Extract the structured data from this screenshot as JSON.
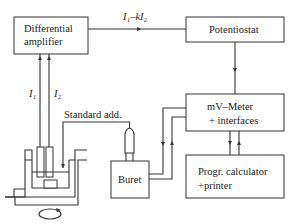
{
  "diagram": {
    "blocks": {
      "differential_amplifier": {
        "line1": "Differential",
        "line2": "amplifier"
      },
      "potentiostat": {
        "label": "Potentiostat"
      },
      "mv_meter": {
        "line1": "mV–Meter",
        "line2": "+ interfaces"
      },
      "calculator": {
        "line1": "Progr. calculator",
        "line2": "+printer"
      },
      "buret": {
        "label": "Buret"
      }
    },
    "signals": {
      "output": "I₁–kI₂",
      "i1": "I₁",
      "i2": "I₂",
      "standard_addition": "Standard add."
    },
    "colors": {
      "line": "#333333",
      "background": "#ffffff"
    }
  }
}
